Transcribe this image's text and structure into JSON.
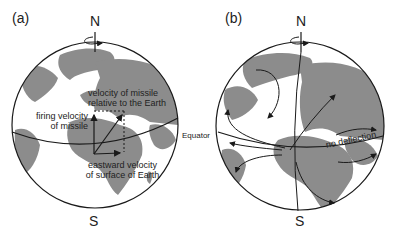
{
  "panels": [
    {
      "id": "a",
      "label": "(a)",
      "north": "N",
      "south": "S",
      "annotations": {
        "relative_velocity": [
          "velocity of missile",
          "relative to the Earth"
        ],
        "firing_velocity": [
          "firing velocity",
          "of missile"
        ],
        "eastward_velocity": [
          "eastward velocity",
          "of surface of Earth"
        ]
      }
    },
    {
      "id": "b",
      "label": "(b)",
      "north": "N",
      "south": "S",
      "annotations": {
        "no_deflection": "no deflection"
      }
    }
  ],
  "equator_label": "Equator",
  "colors": {
    "land": "#8c8c8c",
    "ocean": "#ffffff",
    "line": "#1a1a1a"
  }
}
